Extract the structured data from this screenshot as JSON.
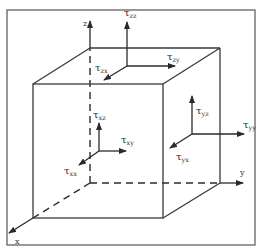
{
  "diagram": {
    "axes": {
      "x": "x",
      "y": "y",
      "z": "z"
    },
    "stress_labels": [
      {
        "id": "tau-zz",
        "symbol": "τ",
        "subscript": "zz"
      },
      {
        "id": "tau-zx",
        "symbol": "τ",
        "subscript": "zx"
      },
      {
        "id": "tau-zy",
        "symbol": "τ",
        "subscript": "zy"
      },
      {
        "id": "tau-yz",
        "symbol": "τ",
        "subscript": "yz"
      },
      {
        "id": "tau-xz",
        "symbol": "τ",
        "subscript": "xz"
      },
      {
        "id": "tau-xy",
        "symbol": "τ",
        "subscript": "xy"
      },
      {
        "id": "tau-xx",
        "symbol": "τ",
        "subscript": "xx"
      },
      {
        "id": "tau-yy",
        "symbol": "τ",
        "subscript": "yy"
      },
      {
        "id": "tau-yx",
        "symbol": "τ",
        "subscript": "yx"
      }
    ],
    "colors": {
      "line": "#3a3a3a",
      "frame": "#555555",
      "background": "#ffffff"
    }
  }
}
